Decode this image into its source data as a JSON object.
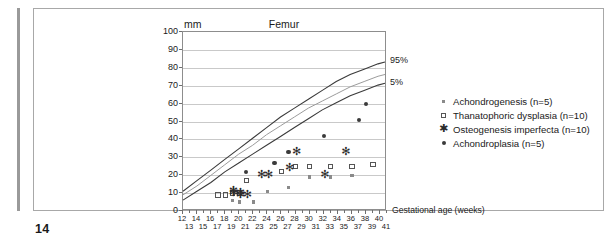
{
  "page": {
    "number": "14"
  },
  "chart_data": {
    "type": "scatter",
    "title": "Femur",
    "ylabel": "mm",
    "xlabel": "Gestational age (weeks)",
    "ylim": [
      0,
      100
    ],
    "xlim": [
      12,
      41
    ],
    "grid": true,
    "ytick_labels": [
      "0",
      "10",
      "20",
      "30",
      "40",
      "50",
      "60",
      "70",
      "80",
      "90",
      "100"
    ],
    "ytick_values": [
      0,
      10,
      20,
      30,
      40,
      50,
      60,
      70,
      80,
      90,
      100
    ],
    "xtick_labels_upper": [
      "12",
      "14",
      "16",
      "18",
      "20",
      "22",
      "24",
      "26",
      "28",
      "30",
      "32",
      "34",
      "36",
      "38",
      "40"
    ],
    "xtick_labels_lower": [
      "13",
      "15",
      "17",
      "19",
      "21",
      "23",
      "25",
      "27",
      "29",
      "31",
      "33",
      "35",
      "37",
      "39",
      "41"
    ],
    "xtick_values": [
      12,
      13,
      14,
      15,
      16,
      17,
      18,
      19,
      20,
      21,
      22,
      23,
      24,
      25,
      26,
      27,
      28,
      29,
      30,
      31,
      32,
      33,
      34,
      35,
      36,
      37,
      38,
      39,
      40,
      41
    ],
    "reference_curves": [
      {
        "name": "95%",
        "label": "95%",
        "points": [
          [
            12,
            10
          ],
          [
            14,
            16
          ],
          [
            16,
            22
          ],
          [
            18,
            28
          ],
          [
            20,
            34
          ],
          [
            22,
            40
          ],
          [
            24,
            46
          ],
          [
            26,
            52
          ],
          [
            28,
            57
          ],
          [
            30,
            62
          ],
          [
            32,
            67
          ],
          [
            34,
            72
          ],
          [
            36,
            76
          ],
          [
            38,
            79
          ],
          [
            40,
            82
          ],
          [
            41,
            83
          ]
        ]
      },
      {
        "name": "50%",
        "label": "",
        "points": [
          [
            12,
            8
          ],
          [
            14,
            13
          ],
          [
            16,
            19
          ],
          [
            18,
            25
          ],
          [
            20,
            31
          ],
          [
            22,
            36
          ],
          [
            24,
            42
          ],
          [
            26,
            47
          ],
          [
            28,
            52
          ],
          [
            30,
            57
          ],
          [
            32,
            61
          ],
          [
            34,
            65
          ],
          [
            36,
            69
          ],
          [
            38,
            72
          ],
          [
            40,
            75
          ],
          [
            41,
            76
          ]
        ]
      },
      {
        "name": "5%",
        "label": "5%",
        "points": [
          [
            12,
            5
          ],
          [
            14,
            10
          ],
          [
            16,
            15
          ],
          [
            18,
            21
          ],
          [
            20,
            26
          ],
          [
            22,
            31
          ],
          [
            24,
            36
          ],
          [
            26,
            41
          ],
          [
            28,
            46
          ],
          [
            30,
            51
          ],
          [
            32,
            56
          ],
          [
            34,
            60
          ],
          [
            36,
            64
          ],
          [
            38,
            67
          ],
          [
            40,
            70
          ],
          [
            41,
            71
          ]
        ]
      }
    ],
    "series": [
      {
        "name": "Achondrogenesis (n=5)",
        "marker": "small-filled-square",
        "legend_label": "Achondrogenesis (n=5)",
        "points": [
          [
            19,
            6
          ],
          [
            20,
            5
          ],
          [
            22,
            5
          ],
          [
            24,
            11
          ],
          [
            27,
            13
          ],
          [
            30,
            19
          ],
          [
            33,
            19
          ],
          [
            36,
            20
          ]
        ]
      },
      {
        "name": "Thanatophoric dysplasia (n=10)",
        "marker": "open-square",
        "legend_label": "Thanatophoric dysplasia (n=10)",
        "points": [
          [
            17,
            9
          ],
          [
            18,
            9
          ],
          [
            19,
            10
          ],
          [
            20,
            10
          ],
          [
            21,
            17
          ],
          [
            26,
            22
          ],
          [
            28,
            25
          ],
          [
            30,
            25
          ],
          [
            33,
            25
          ],
          [
            36,
            25
          ],
          [
            39,
            26
          ]
        ]
      },
      {
        "name": "Osteogenesis imperfecta (n=10)",
        "marker": "asterisk",
        "legend_label": "Osteogenesis imperfecta (n=10)",
        "points": [
          [
            19,
            10
          ],
          [
            19,
            11
          ],
          [
            20,
            10
          ],
          [
            20,
            9
          ],
          [
            21,
            9
          ],
          [
            23,
            20
          ],
          [
            24,
            20
          ],
          [
            27,
            24
          ],
          [
            28,
            33
          ],
          [
            32,
            20
          ],
          [
            35,
            33
          ]
        ]
      },
      {
        "name": "Achondroplasia (n=5)",
        "marker": "filled-circle",
        "legend_label": "Achondroplasia (n=5)",
        "points": [
          [
            21,
            22
          ],
          [
            25,
            27
          ],
          [
            27,
            33
          ],
          [
            32,
            42
          ],
          [
            37,
            51
          ],
          [
            38,
            60
          ]
        ]
      }
    ]
  }
}
